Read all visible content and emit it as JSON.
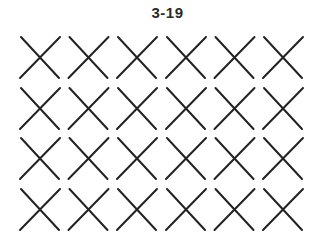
{
  "figure": {
    "label": "3-19",
    "rows": 4,
    "cols": 6,
    "stroke_color": "#222222",
    "background": "#ffffff",
    "cells": [
      [
        {
          "shape": "x"
        },
        {
          "shape": "x"
        },
        {
          "shape": "x"
        },
        {
          "shape": "x"
        },
        {
          "shape": "x"
        },
        {
          "shape": "x"
        }
      ],
      [
        {
          "shape": "x"
        },
        {
          "shape": "x"
        },
        {
          "shape": "x"
        },
        {
          "shape": "x"
        },
        {
          "shape": "x"
        },
        {
          "shape": "x"
        }
      ],
      [
        {
          "shape": "x"
        },
        {
          "shape": "x"
        },
        {
          "shape": "x"
        },
        {
          "shape": "x"
        },
        {
          "shape": "x"
        },
        {
          "shape": "x"
        }
      ],
      [
        {
          "shape": "x"
        },
        {
          "shape": "x"
        },
        {
          "shape": "x"
        },
        {
          "shape": "x"
        },
        {
          "shape": "x"
        },
        {
          "shape": "x"
        }
      ]
    ]
  }
}
